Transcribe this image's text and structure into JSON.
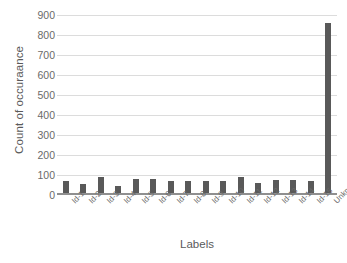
{
  "chart_data": {
    "type": "bar",
    "title": "",
    "xlabel": "Labels",
    "ylabel": "Count of occuraance",
    "categories": [
      "Id-1",
      "Id-2",
      "Id-3",
      "Id-4",
      "Id-5",
      "Id-6",
      "Id-7",
      "Id-8",
      "Id-9",
      "Id-10",
      "Id-11",
      "Id-12",
      "Id-13",
      "Id-14",
      "Id-15",
      "Unknown"
    ],
    "values": [
      70,
      55,
      90,
      45,
      78,
      78,
      72,
      68,
      72,
      68,
      90,
      60,
      75,
      77,
      72,
      860
    ],
    "ylim": [
      0,
      900
    ],
    "yticks": [
      0,
      100,
      200,
      300,
      400,
      500,
      600,
      700,
      800,
      900
    ],
    "ytick_labels": [
      "0",
      "100",
      "200",
      "300",
      "400",
      "500",
      "600",
      "700",
      "800",
      "900"
    ],
    "grid": true,
    "legend": false,
    "bar_color": "#595959",
    "gridline_color": "#dcdcdc",
    "axis_color": "#8f8f8f",
    "text_color": "#6a6a6a",
    "background_color": "#ffffff"
  }
}
